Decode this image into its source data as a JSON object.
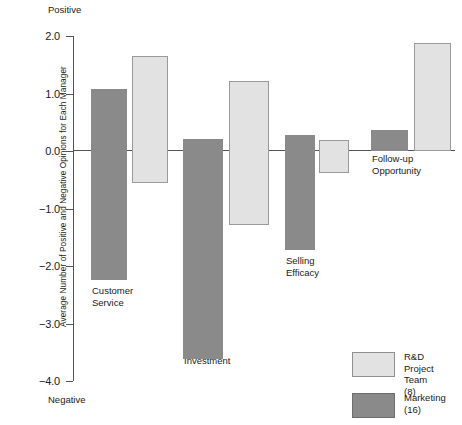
{
  "chart_data": {
    "type": "bar",
    "title": "",
    "xlabel": "",
    "ylabel": "Average Number of Positive and Negative Opinions for Each Manager",
    "ylim": [
      -4.0,
      2.0
    ],
    "yticks": [
      "2.0",
      "1.0",
      "0.0",
      "-1.0",
      "-2.0",
      "-3.0",
      "-4.0"
    ],
    "ytick_values": [
      2.0,
      1.0,
      0.0,
      -1.0,
      -2.0,
      -3.0,
      -4.0
    ],
    "grid": false,
    "legend_position": "bottom-right",
    "axis_top_caption": "Positive",
    "axis_bottom_caption": "Negative",
    "categories": [
      "Customer\nService",
      "Investment",
      "Selling\nEfficacy",
      "Follow-up\nOpportunity"
    ],
    "series": [
      {
        "name": "Marketing (16)",
        "color": "#8a8a8a",
        "positive": [
          1.08,
          0.21,
          0.28,
          0.37
        ],
        "negative": [
          -2.25,
          -3.62,
          -1.72,
          0.0
        ]
      },
      {
        "name": "R&D Project Team (8)",
        "color": "#e2e2e2",
        "positive": [
          1.65,
          1.21,
          0.19,
          1.88
        ],
        "negative": [
          -0.55,
          -1.28,
          -0.39,
          0.0
        ]
      }
    ]
  },
  "legend": {
    "items": [
      {
        "label": "R&D Project\nTeam (8)",
        "style": "light"
      },
      {
        "label": "Marketing\n(16)",
        "style": "dark"
      }
    ]
  },
  "colors": {
    "dark_bar": "#8a8a8a",
    "light_bar": "#e2e2e2",
    "axis": "#555555",
    "background": "#ffffff"
  }
}
